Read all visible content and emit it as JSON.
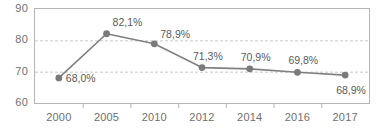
{
  "chart_data": {
    "type": "line",
    "title": "",
    "subtitle": "",
    "xlabel": "",
    "ylabel": "",
    "categories": [
      "2000",
      "2005",
      "2010",
      "2012",
      "2014",
      "2016",
      "2017"
    ],
    "values": [
      68.0,
      82.1,
      78.9,
      71.3,
      70.9,
      69.8,
      68.9
    ],
    "point_labels": [
      "68,0%",
      "82,1%",
      "78,9%",
      "71,3%",
      "70,9%",
      "69,8%",
      "68,9%"
    ],
    "ylim": [
      60,
      90
    ],
    "yticks": [
      60,
      70,
      80,
      90
    ],
    "ytick_labels": [
      "60",
      "70",
      "80",
      "90"
    ],
    "grid": true,
    "gridlines_at": [
      70,
      80
    ],
    "legend": "none",
    "series_color": "#808080",
    "marker_color": "#7a7a7a",
    "grid_color": "#c9c9c9",
    "axis_color": "#b5b5b5",
    "text_color": "#6f6f6f",
    "label_color": "#5a5a5a",
    "background_color": "#ffffff"
  }
}
